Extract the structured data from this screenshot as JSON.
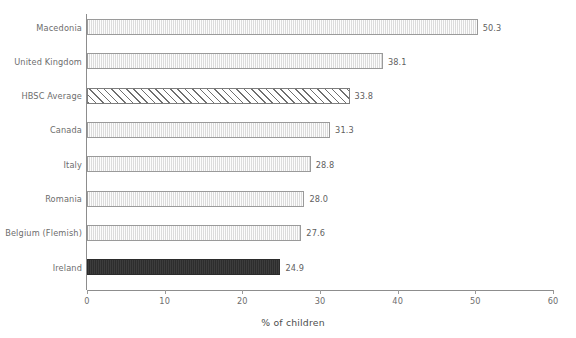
{
  "chart_data": {
    "type": "bar",
    "orientation": "horizontal",
    "title": "",
    "subtitle": "",
    "xlabel": "% of children",
    "ylabel": "",
    "xlim": [
      0,
      60
    ],
    "xticks": [
      0,
      10,
      20,
      30,
      40,
      50,
      60
    ],
    "xtick_labels": [
      "0",
      "10",
      "20",
      "30",
      "40",
      "50",
      "60"
    ],
    "grid": false,
    "legend": null,
    "categories": [
      "Macedonia",
      "United Kingdom",
      "HBSC Average",
      "Canada",
      "Italy",
      "Romania",
      "Belgium (Flemish)",
      "Ireland"
    ],
    "values": [
      50.3,
      38.1,
      33.8,
      31.3,
      28.8,
      28.0,
      27.6,
      24.9
    ],
    "value_labels": [
      "50.3",
      "38.1",
      "33.8",
      "31.3",
      "28.8",
      "28.0",
      "27.6",
      "24.9"
    ],
    "bar_styles": [
      "plain",
      "plain",
      "hatched",
      "plain",
      "plain",
      "plain",
      "plain",
      "solid"
    ],
    "colors": {
      "bar_fill": "#ededed",
      "bar_border": "#9a9a9a",
      "hatch_line": "#6f6f6f",
      "highlight_fill": "#333333",
      "axis": "#8d8d8d",
      "text": "#6d6d6d",
      "background": "#ffffff"
    }
  }
}
